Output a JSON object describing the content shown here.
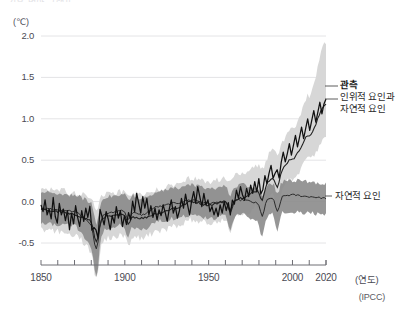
{
  "figure": {
    "cropped_header_text": "기후 변화 그래프",
    "source": "(IPCC)",
    "unit_label": "(℃)",
    "x_axis_name": "(연도)"
  },
  "chart_data": {
    "type": "line",
    "title": "",
    "subtitle": "",
    "xlabel": "(연도)",
    "ylabel": "(℃)",
    "xlim": [
      1850,
      2020
    ],
    "ylim": [
      -0.72,
      2.12
    ],
    "grid": "horizontal",
    "legend_position": "right-inline",
    "x_ticks_major": [
      1850,
      1900,
      1950,
      2000,
      2020
    ],
    "x_ticks_minor_step": 10,
    "y_ticks": [
      -0.5,
      0.0,
      0.5,
      1.0,
      1.5,
      2.0
    ],
    "y_tick_labels": [
      "-0.5",
      "0.0",
      "0.5",
      "1.0",
      "1.5",
      "2.0"
    ],
    "colors": {
      "observed_line": "#111111",
      "human_natural_line": "#222222",
      "human_natural_band": "#d7d7d7",
      "natural_line": "#2b2b2b",
      "natural_band": "#8b8b8b",
      "gridline": "#e4e4e6",
      "axis": "#6e6e74"
    },
    "series": [
      {
        "name": "관측",
        "key": "observed",
        "label": "관측",
        "label_bold": true,
        "style": "line",
        "x": [
          1850,
          1855,
          1860,
          1865,
          1870,
          1875,
          1880,
          1885,
          1890,
          1895,
          1900,
          1905,
          1910,
          1915,
          1920,
          1925,
          1930,
          1935,
          1940,
          1945,
          1950,
          1955,
          1960,
          1965,
          1970,
          1975,
          1980,
          1985,
          1990,
          1995,
          2000,
          2005,
          2010,
          2015,
          2020
        ],
        "values": [
          -0.05,
          -0.12,
          -0.14,
          -0.06,
          -0.1,
          -0.18,
          -0.12,
          -0.22,
          -0.2,
          -0.25,
          -0.14,
          -0.26,
          -0.3,
          -0.14,
          -0.16,
          -0.14,
          -0.05,
          -0.1,
          0.08,
          0.02,
          -0.12,
          -0.1,
          -0.06,
          -0.12,
          0.0,
          -0.08,
          0.16,
          0.08,
          0.26,
          0.28,
          0.38,
          0.56,
          0.62,
          0.86,
          1.06
        ],
        "detail": [
          -0.04,
          -0.12,
          0.02,
          -0.16,
          -0.09,
          -0.21,
          0.05,
          -0.18,
          -0.26,
          -0.02,
          -0.16,
          -0.09,
          -0.23,
          -0.11,
          -0.34,
          -0.14,
          -0.27,
          -0.05,
          -0.19,
          -0.3,
          -0.11,
          -0.24,
          -0.08,
          -0.19,
          -0.05,
          -0.3,
          -0.16,
          -0.09,
          -0.24,
          -0.02,
          -0.17,
          -0.28,
          -0.12,
          -0.21,
          -0.34,
          -0.17,
          -0.26,
          -0.06,
          -0.2,
          -0.11,
          -0.3,
          -0.16,
          -0.22,
          -0.05,
          -0.18,
          0.01,
          -0.12,
          0.1,
          -0.02,
          -0.14,
          0.06,
          -0.08,
          0.04,
          -0.16,
          -0.05,
          -0.19,
          -0.08,
          -0.22,
          -0.1,
          -0.17,
          -0.04,
          -0.13,
          -0.24,
          -0.09,
          0.02,
          -0.14,
          -0.06,
          -0.2,
          -0.11,
          0.04,
          -0.08,
          0.09,
          -0.04,
          -0.16,
          0.01,
          0.12,
          -0.02,
          0.18,
          0.06,
          -0.06,
          0.1,
          -0.04,
          0.02,
          -0.12,
          -0.06,
          -0.16,
          -0.08,
          -0.18,
          -0.04,
          -0.14,
          0.0,
          -0.1,
          0.04,
          -0.06,
          0.08,
          -0.02,
          0.14,
          0.04,
          0.18,
          0.08,
          0.02,
          0.16,
          0.06,
          0.2,
          0.1,
          0.24,
          0.12,
          0.3,
          0.18,
          0.26,
          0.36,
          0.22,
          0.34,
          0.44,
          0.3,
          0.42,
          0.52,
          0.38,
          0.5,
          0.6,
          0.48,
          0.58,
          0.7,
          0.56,
          0.68,
          0.8,
          0.66,
          0.78,
          0.9,
          0.76,
          0.88,
          1.0,
          0.86,
          0.98,
          1.1,
          0.96,
          1.08,
          1.2,
          1.06,
          1.18,
          1.24
        ]
      },
      {
        "name": "인위적 요인과 자연적 요인",
        "key": "human_natural",
        "label": "인위적 요인과\n자연적 요인",
        "label_line1": "인위적 요인과",
        "label_line2": "자연적 요인",
        "label_bold": false,
        "style": "line+band",
        "x": [
          1850,
          1860,
          1870,
          1880,
          1890,
          1900,
          1910,
          1920,
          1930,
          1940,
          1950,
          1960,
          1970,
          1980,
          1990,
          2000,
          2010,
          2020
        ],
        "values": [
          -0.1,
          -0.12,
          -0.16,
          -0.22,
          -0.18,
          -0.16,
          -0.2,
          -0.14,
          -0.08,
          0.0,
          -0.04,
          0.0,
          0.04,
          0.14,
          0.32,
          0.52,
          0.8,
          1.18
        ],
        "band_lower": [
          -0.34,
          -0.36,
          -0.4,
          -0.58,
          -0.44,
          -0.4,
          -0.44,
          -0.36,
          -0.3,
          -0.22,
          -0.26,
          -0.22,
          -0.16,
          -0.06,
          0.1,
          0.28,
          0.52,
          0.76
        ],
        "band_upper": [
          0.18,
          0.14,
          0.1,
          0.06,
          0.1,
          0.12,
          0.08,
          0.14,
          0.2,
          0.28,
          0.24,
          0.28,
          0.34,
          0.44,
          0.64,
          0.88,
          1.28,
          1.92
        ]
      },
      {
        "name": "자연적 요인",
        "key": "natural",
        "label": "자연적 요인",
        "label_bold": false,
        "style": "line+band",
        "x": [
          1850,
          1860,
          1870,
          1880,
          1890,
          1900,
          1910,
          1920,
          1930,
          1940,
          1950,
          1960,
          1970,
          1980,
          1990,
          2000,
          2010,
          2020
        ],
        "values": [
          -0.08,
          -0.1,
          -0.12,
          -0.26,
          -0.14,
          -0.1,
          -0.16,
          -0.06,
          -0.02,
          0.02,
          -0.02,
          0.0,
          0.02,
          -0.02,
          0.06,
          0.08,
          0.06,
          0.04
        ],
        "band_lower": [
          -0.26,
          -0.28,
          -0.3,
          -0.52,
          -0.32,
          -0.28,
          -0.34,
          -0.24,
          -0.2,
          -0.16,
          -0.2,
          -0.18,
          -0.16,
          -0.24,
          -0.12,
          -0.12,
          -0.14,
          -0.16
        ],
        "band_upper": [
          0.12,
          0.1,
          0.08,
          0.0,
          0.06,
          0.1,
          0.04,
          0.12,
          0.16,
          0.2,
          0.16,
          0.18,
          0.2,
          0.16,
          0.24,
          0.26,
          0.24,
          0.22
        ]
      }
    ],
    "annotations": [
      {
        "name": "observed-callout",
        "text": "관측",
        "bold": true
      },
      {
        "name": "human-natural-callout",
        "text": "인위적 요인과 자연적 요인",
        "bold": false
      },
      {
        "name": "natural-callout",
        "text": "자연적 요인",
        "bold": false
      }
    ]
  }
}
